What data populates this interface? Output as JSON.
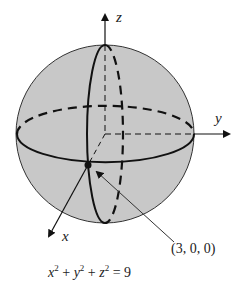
{
  "diagram": {
    "axes": {
      "x": "x",
      "y": "y",
      "z": "z"
    },
    "point_label": "(3, 0, 0)",
    "equation": {
      "parts": [
        "x",
        "2",
        " + ",
        "y",
        "2",
        " + ",
        "z",
        "2",
        " = 9"
      ]
    },
    "colors": {
      "sphere_fill": "#c8c8c8",
      "stroke": "#111111"
    }
  }
}
